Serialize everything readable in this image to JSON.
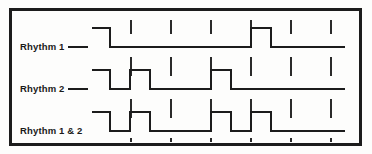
{
  "figure": {
    "background_color": "#fdfdfc",
    "line_color": "#1c1c1c",
    "border": {
      "x": 10.5,
      "y": 9.5,
      "width": 350,
      "height": 135,
      "stroke_width": 2.4
    }
  },
  "grid": {
    "tick_positions": [
      131,
      171,
      211,
      251,
      291,
      331
    ],
    "tick_color": "#2a2a2a",
    "tick_stroke_width": 1.5,
    "description": "Short vertical beat-division tick marks above and below each baseline"
  },
  "tracks": [
    {
      "id": "rhythm-1",
      "label": "Rhythm 1",
      "has_leader_dash": true,
      "label_x": 20,
      "label_y": 50,
      "dash_x1": 68,
      "dash_x2": 88,
      "dash_y": 47,
      "baseline_y": 47,
      "high_y": 28,
      "start_x": 92,
      "end_x": 345,
      "pulses": [
        {
          "start": 92,
          "end": 110,
          "open_start": true
        },
        {
          "start": 251,
          "end": 271
        }
      ]
    },
    {
      "id": "rhythm-2",
      "label": "Rhythm 2",
      "has_leader_dash": true,
      "label_x": 20,
      "label_y": 92,
      "dash_x1": 68,
      "dash_x2": 88,
      "dash_y": 89,
      "baseline_y": 89,
      "high_y": 70,
      "start_x": 92,
      "end_x": 345,
      "pulses": [
        {
          "start": 92,
          "end": 110,
          "open_start": true
        },
        {
          "start": 130,
          "end": 150
        },
        {
          "start": 211,
          "end": 231
        }
      ]
    },
    {
      "id": "rhythm-1-and-2",
      "label": "Rhythm 1 & 2",
      "has_leader_dash": false,
      "label_x": 20,
      "label_y": 134,
      "baseline_y": 131,
      "high_y": 112,
      "start_x": 92,
      "end_x": 345,
      "pulses": [
        {
          "start": 92,
          "end": 110,
          "open_start": true
        },
        {
          "start": 130,
          "end": 150
        },
        {
          "start": 211,
          "end": 231
        },
        {
          "start": 251,
          "end": 271
        }
      ]
    }
  ],
  "tick_rows": [
    {
      "track": "rhythm-1",
      "above_y1": 20,
      "above_y2": 34,
      "below_y1": 57,
      "below_y2": 66
    },
    {
      "track": "rhythm-2",
      "above_y1": 62,
      "above_y2": 76,
      "below_y1": 99,
      "below_y2": 108
    },
    {
      "track": "rhythm-1-and-2",
      "above_y1": 104,
      "above_y2": 118,
      "below_y1": 138,
      "below_y2": 142
    }
  ]
}
